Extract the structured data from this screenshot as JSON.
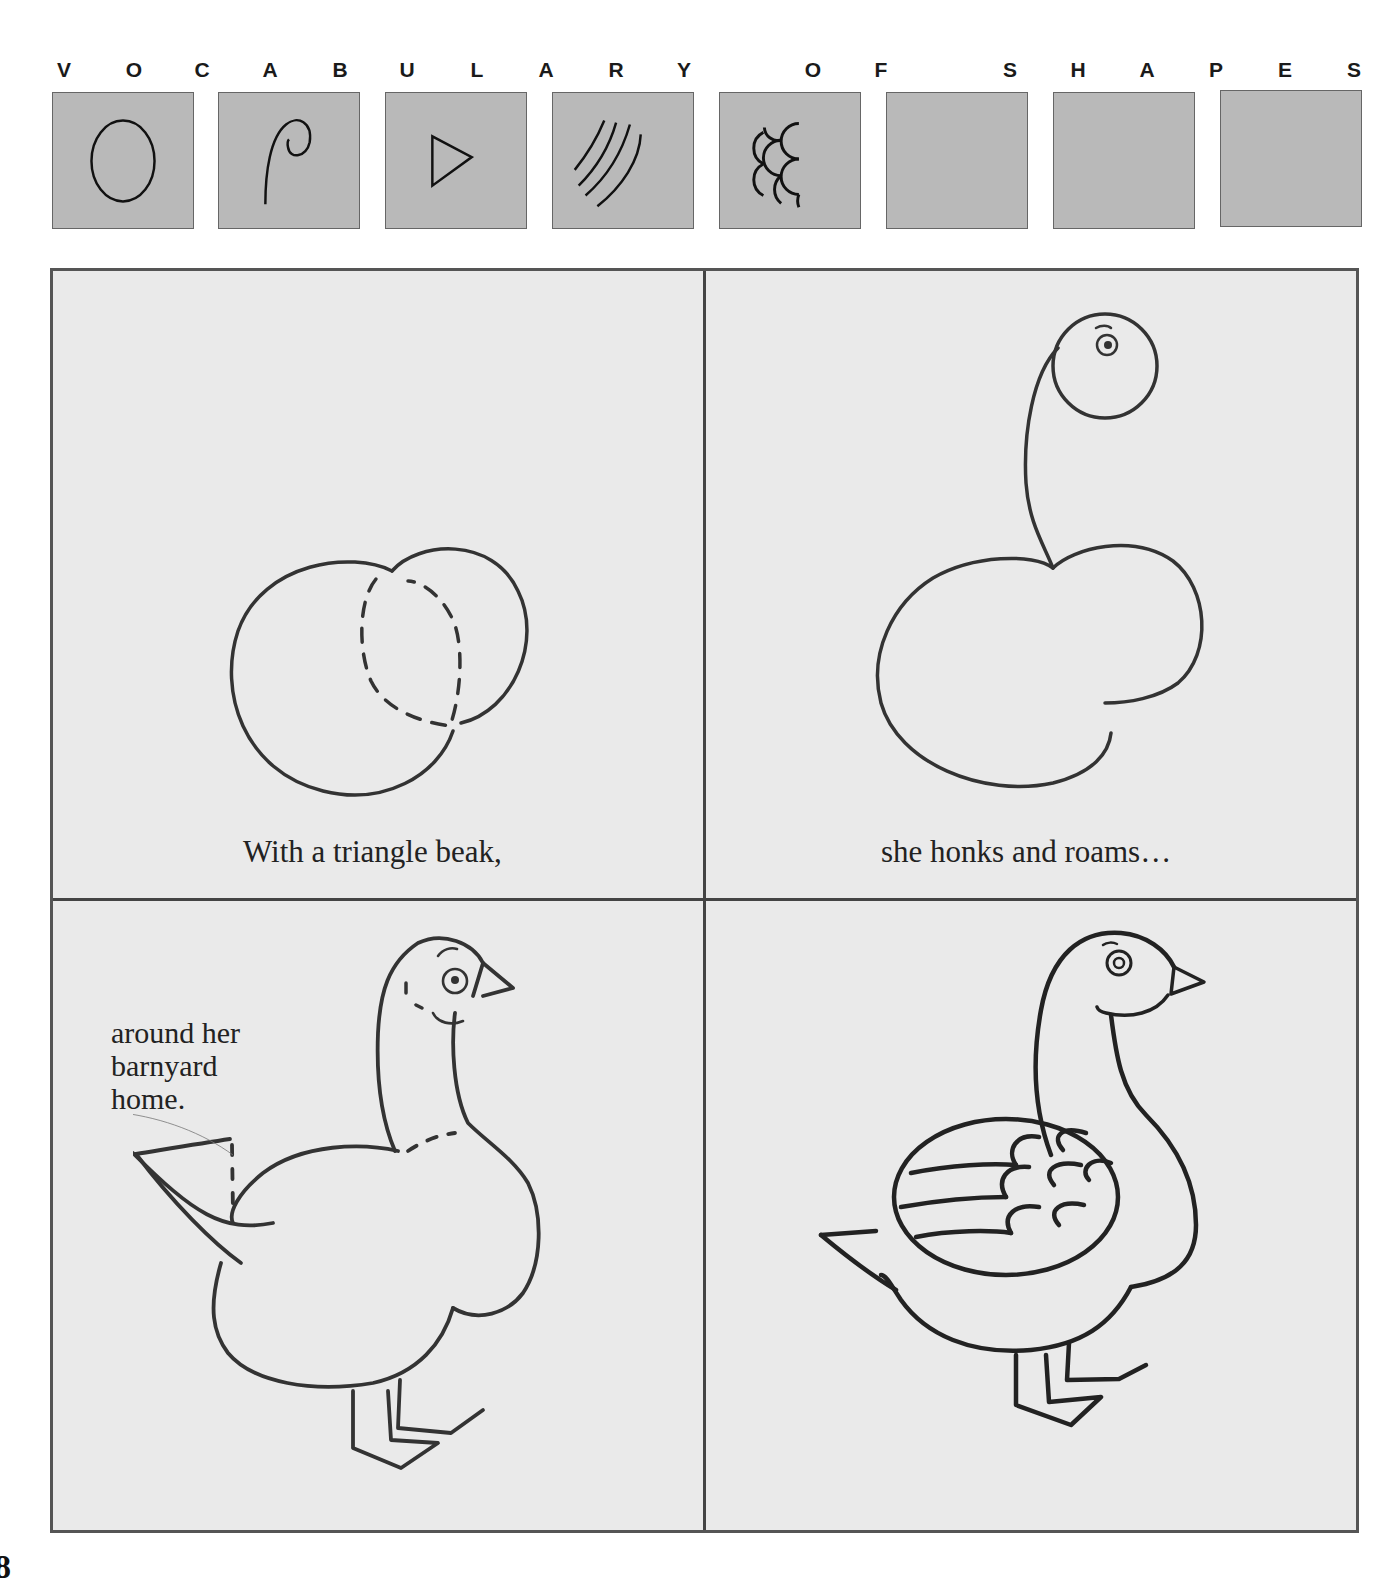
{
  "header": {
    "letters": [
      {
        "char": "V",
        "x": 64
      },
      {
        "char": "O",
        "x": 134
      },
      {
        "char": "C",
        "x": 202
      },
      {
        "char": "A",
        "x": 270
      },
      {
        "char": "B",
        "x": 340
      },
      {
        "char": "U",
        "x": 407
      },
      {
        "char": "L",
        "x": 477
      },
      {
        "char": "A",
        "x": 546
      },
      {
        "char": "R",
        "x": 616
      },
      {
        "char": "Y",
        "x": 684
      },
      {
        "char": "O",
        "x": 813
      },
      {
        "char": "F",
        "x": 881
      },
      {
        "char": "S",
        "x": 1010
      },
      {
        "char": "H",
        "x": 1078
      },
      {
        "char": "A",
        "x": 1147
      },
      {
        "char": "P",
        "x": 1216
      },
      {
        "char": "E",
        "x": 1285
      },
      {
        "char": "S",
        "x": 1354
      }
    ]
  },
  "shape_tiles": [
    {
      "shape": "circle",
      "x": 52
    },
    {
      "shape": "spiral",
      "x": 218
    },
    {
      "shape": "triangle",
      "x": 385
    },
    {
      "shape": "curved-lines",
      "x": 552
    },
    {
      "shape": "scallops",
      "x": 719
    },
    {
      "shape": "empty",
      "x": 886
    },
    {
      "shape": "empty",
      "x": 1053
    },
    {
      "shape": "empty",
      "x": 1220
    }
  ],
  "tile_color": "#b9b9b9",
  "panels": [
    {
      "step": 1,
      "caption": "With a triangle beak,"
    },
    {
      "step": 2,
      "caption": "she honks and roams…"
    },
    {
      "step": 3,
      "caption_lines": [
        "around her",
        "barnyard",
        "home."
      ]
    },
    {
      "step": 4,
      "caption": ""
    }
  ],
  "page_number": "8"
}
